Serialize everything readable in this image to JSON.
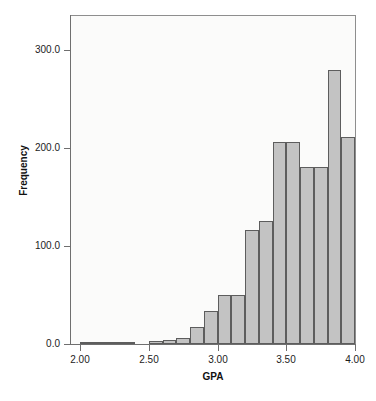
{
  "chart_data": {
    "type": "bar",
    "title": "",
    "subtitle": "",
    "xlabel": "GPA",
    "ylabel": "Frequency",
    "xlim": [
      2.0,
      4.0
    ],
    "ylim": [
      0,
      330
    ],
    "grid": false,
    "legend": null,
    "bin_width": 0.1,
    "xticks": [
      "2.00",
      "2.50",
      "3.00",
      "3.50",
      "4.00"
    ],
    "xtick_values": [
      2.0,
      2.5,
      3.0,
      3.5,
      4.0
    ],
    "yticks": [
      "0.0",
      "100.0",
      "200.0",
      "300.0"
    ],
    "ytick_values": [
      0,
      100,
      200,
      300
    ],
    "bar_color": "#c3c3c3",
    "bar_edge_color": "#5d5d5d",
    "axis_color": "#6f6f6f",
    "plot_background": "#fbfbfa",
    "categories": [
      "2.00-2.10",
      "2.10-2.20",
      "2.20-2.30",
      "2.30-2.40",
      "2.40-2.50",
      "2.50-2.60",
      "2.60-2.70",
      "2.70-2.80",
      "2.80-2.90",
      "2.90-3.00",
      "3.00-3.10",
      "3.10-3.20",
      "3.20-3.30",
      "3.30-3.40",
      "3.40-3.50",
      "3.50-3.60",
      "3.60-3.70",
      "3.70-3.80",
      "3.80-3.90",
      "3.90-4.00"
    ],
    "bin_starts": [
      2.0,
      2.1,
      2.2,
      2.3,
      2.4,
      2.5,
      2.6,
      2.7,
      2.8,
      2.9,
      3.0,
      3.1,
      3.2,
      3.3,
      3.4,
      3.5,
      3.6,
      3.7,
      3.8,
      3.9
    ],
    "values": [
      1,
      1,
      1,
      1,
      0,
      2,
      3,
      5,
      16,
      33,
      49,
      49,
      115,
      125,
      205,
      205,
      180,
      180,
      279,
      210
    ]
  }
}
